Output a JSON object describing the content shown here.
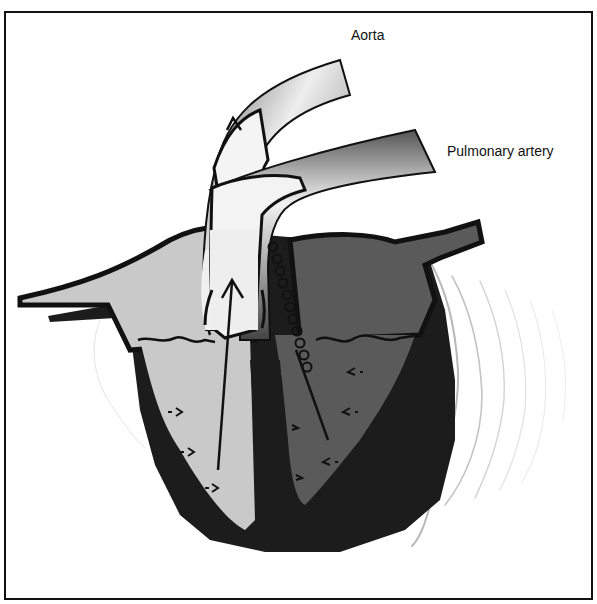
{
  "diagram": {
    "type": "anatomical illustration",
    "labels": {
      "aorta": "Aorta",
      "pulmonary_artery": "Pulmonary artery"
    },
    "colors": {
      "background": "#ffffff",
      "border": "#111111",
      "outline": "#111111",
      "left_ventricle_fill": "#c9c9c9",
      "right_ventricle_fill": "#5a5a5a",
      "myocardium": "#1c1c1c",
      "vessel_light": "#f0f0f0",
      "vessel_dark": "#6a6a6a",
      "vibration_lines": "#bdbdbd"
    },
    "elements": [
      "aorta-tube",
      "pulmonary-artery-tube",
      "left-ventricle",
      "right-ventricle",
      "myocardium-wall",
      "valve-leaflets",
      "ejection-arrows",
      "wall-motion-arrows",
      "coil-spring",
      "vibration-waves"
    ]
  }
}
